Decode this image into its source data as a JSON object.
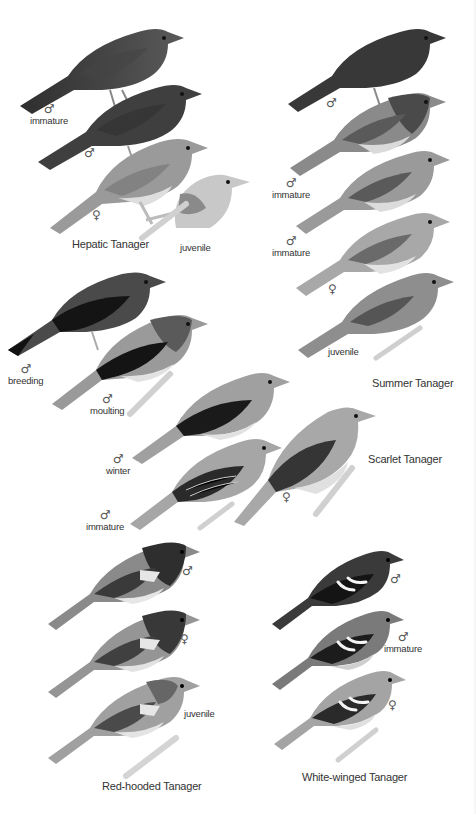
{
  "species": [
    {
      "name": "Hepatic Tanager",
      "labels": [
        {
          "symbol": "♂",
          "text": "immature"
        },
        {
          "symbol": "♂",
          "text": ""
        },
        {
          "symbol": "♀",
          "text": ""
        },
        {
          "symbol": "",
          "text": "juvenile"
        }
      ]
    },
    {
      "name": "Summer Tanager",
      "labels": [
        {
          "symbol": "♂",
          "text": ""
        },
        {
          "symbol": "♂",
          "text": "immature"
        },
        {
          "symbol": "♂",
          "text": "immature"
        },
        {
          "symbol": "♀",
          "text": ""
        },
        {
          "symbol": "",
          "text": "juvenile"
        }
      ]
    },
    {
      "name": "Scarlet Tanager",
      "labels": [
        {
          "symbol": "♂",
          "text": "breeding"
        },
        {
          "symbol": "♂",
          "text": "moulting"
        },
        {
          "symbol": "♂",
          "text": "winter"
        },
        {
          "symbol": "♂",
          "text": "immature"
        },
        {
          "symbol": "♀",
          "text": ""
        }
      ]
    },
    {
      "name": "Red-hooded Tanager",
      "labels": [
        {
          "symbol": "♂",
          "text": ""
        },
        {
          "symbol": "♀",
          "text": ""
        },
        {
          "symbol": "",
          "text": "juvenile"
        }
      ]
    },
    {
      "name": "White-winged Tanager",
      "labels": [
        {
          "symbol": "♂",
          "text": ""
        },
        {
          "symbol": "♂",
          "text": "immature"
        },
        {
          "symbol": "♀",
          "text": ""
        }
      ]
    }
  ],
  "colors": {
    "background": "#ffffff",
    "text": "#333333",
    "dark_plumage": "#3a3a3a",
    "mid_plumage": "#7a7a7a",
    "light_plumage": "#c8c8c8"
  }
}
